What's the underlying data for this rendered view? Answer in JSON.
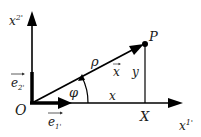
{
  "diagram": {
    "type": "polar-coordinates",
    "labels": {
      "vertical_axis": "x",
      "vertical_axis_sup": "2'",
      "horizontal_axis": "x",
      "horizontal_axis_sup": "1'",
      "origin": "O",
      "point": "P",
      "radius": "ρ",
      "angle": "φ",
      "position_vector": "x",
      "x_component": "x",
      "y_component": "y",
      "foot_point": "X",
      "unit_vector_2": "e",
      "unit_vector_2_sub": "2'",
      "unit_vector_1": "e",
      "unit_vector_1_sub": "1'"
    },
    "colors": {
      "line": "#000000",
      "text": "#1a1a1a",
      "background": "#ffffff"
    }
  }
}
